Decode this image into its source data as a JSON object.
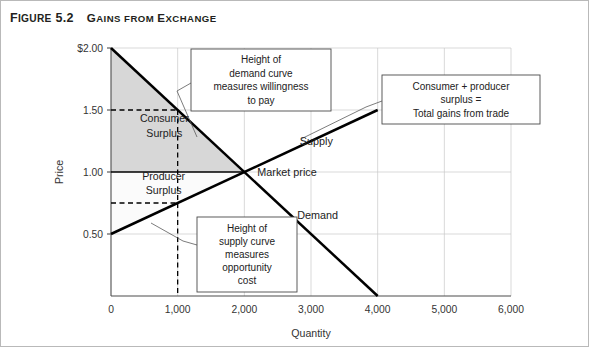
{
  "figure": {
    "number_prefix": "F",
    "number_rest": "IGURE",
    "number_value": "5.2",
    "title_first": "G",
    "title_rest": "AINS FROM ",
    "title_e": "E",
    "title_tail": "XCHANGE"
  },
  "chart_data": {
    "type": "line",
    "title": "Gains from Exchange",
    "xlabel": "Quantity",
    "ylabel": "Price",
    "xlim": [
      0,
      6000
    ],
    "ylim": [
      0,
      2.0
    ],
    "grid": true,
    "xticks": [
      "0",
      "1,000",
      "2,000",
      "3,000",
      "4,000",
      "5,000",
      "6,000"
    ],
    "xtick_values": [
      0,
      1000,
      2000,
      3000,
      4000,
      5000,
      6000
    ],
    "yticks": [
      "$2.00",
      "1.50",
      "1.00",
      "0.50"
    ],
    "ytick_values": [
      2.0,
      1.5,
      1.0,
      0.5
    ],
    "series": [
      {
        "name": "Demand",
        "points": [
          [
            0,
            2.0
          ],
          [
            4000,
            0.0
          ]
        ],
        "label": "Demand",
        "label_x": 3100,
        "label_y": 0.62
      },
      {
        "name": "Supply",
        "points": [
          [
            0,
            0.5
          ],
          [
            4000,
            1.5
          ]
        ],
        "label": "Supply",
        "label_x": 3080,
        "label_y": 1.22
      }
    ],
    "equilibrium": {
      "quantity": 2000,
      "price": 1.0,
      "label": "Market price"
    },
    "market_price_line": {
      "price": 1.0,
      "from_q": 0,
      "to_q": 2000
    },
    "guides": {
      "quantity": 1000,
      "demand_height": 1.5,
      "supply_height": 0.75
    },
    "regions": [
      {
        "name": "consumer-surplus",
        "label_line1": "Consumer",
        "label_line2": "Surplus",
        "fill": "#d7d7d7"
      },
      {
        "name": "producer-surplus",
        "label_line1": "Producer",
        "label_line2": "Surplus",
        "fill": "#fbfbfb"
      }
    ],
    "annotations": [
      {
        "name": "demand-height-callout",
        "lines": [
          "Height of",
          "demand curve",
          "measures willingness",
          "to pay"
        ]
      },
      {
        "name": "total-gains-callout",
        "lines": [
          "Consumer + producer",
          "surplus =",
          "Total gains from trade"
        ]
      },
      {
        "name": "supply-height-callout",
        "lines": [
          "Height of",
          "supply curve",
          "measures",
          "opportunity",
          "cost"
        ]
      }
    ]
  }
}
